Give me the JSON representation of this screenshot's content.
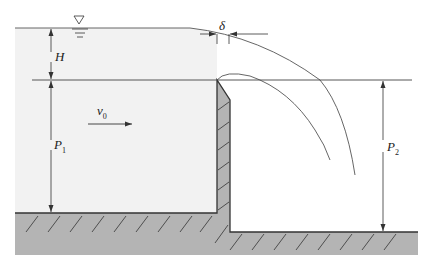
{
  "diagram": {
    "type": "sharp-crested weir flow (hydraulics)",
    "labels": {
      "head": "H",
      "upstream_height": "P",
      "upstream_height_sub": "1",
      "downstream_height": "P",
      "downstream_height_sub": "2",
      "approach_velocity": "v",
      "approach_velocity_sub": "0",
      "crest_thickness": "δ"
    },
    "symbols": {
      "water_surface": "water-surface-triangle"
    },
    "colors": {
      "water": "#f2f2f2",
      "ground": "#b4b4b4",
      "line": "#333333"
    }
  }
}
